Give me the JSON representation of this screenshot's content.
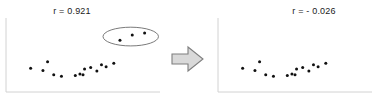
{
  "figure": {
    "caption_left": "r = 0.921",
    "caption_right": "r = - 0.026",
    "arrow_icon": "right-block-arrow-icon",
    "colors": {
      "point": "#111111",
      "axis": "#d2d2d2",
      "ellipse": "#6b6b6b",
      "arrow_fill": "#d9d9d9",
      "arrow_stroke": "#7f7f7f",
      "text": "#1a1a1a"
    }
  },
  "chart_data": [
    {
      "type": "scatter",
      "title": "r = 0.921",
      "panel": "left",
      "xlabel": "",
      "ylabel": "",
      "xlim": [
        0,
        100
      ],
      "ylim": [
        0,
        100
      ],
      "grid": false,
      "legend": null,
      "annotations": [
        {
          "kind": "ellipse",
          "label": "outlier-group-highlight",
          "cx": 81,
          "cy": 77,
          "rx": 18,
          "ry": 13
        }
      ],
      "series": [
        {
          "name": "main cluster",
          "points": [
            [
              16,
              33
            ],
            [
              27,
              42
            ],
            [
              24,
              30
            ],
            [
              31,
              24
            ],
            [
              36,
              22
            ],
            [
              45,
              23
            ],
            [
              48,
              25
            ],
            [
              50,
              24
            ],
            [
              51,
              32
            ],
            [
              55,
              34
            ],
            [
              59,
              29
            ],
            [
              62,
              38
            ],
            [
              65,
              35
            ],
            [
              70,
              40
            ]
          ]
        },
        {
          "name": "outliers",
          "points": [
            [
              74,
              72
            ],
            [
              82,
              79
            ],
            [
              90,
              82
            ]
          ]
        }
      ]
    },
    {
      "type": "scatter",
      "title": "r = - 0.026",
      "panel": "right",
      "xlabel": "",
      "ylabel": "",
      "xlim": [
        0,
        100
      ],
      "ylim": [
        0,
        100
      ],
      "grid": false,
      "legend": null,
      "annotations": [],
      "series": [
        {
          "name": "main cluster",
          "points": [
            [
              16,
              33
            ],
            [
              27,
              42
            ],
            [
              24,
              30
            ],
            [
              31,
              24
            ],
            [
              36,
              22
            ],
            [
              45,
              23
            ],
            [
              48,
              25
            ],
            [
              50,
              24
            ],
            [
              51,
              32
            ],
            [
              55,
              34
            ],
            [
              59,
              29
            ],
            [
              62,
              38
            ],
            [
              65,
              35
            ],
            [
              70,
              40
            ]
          ]
        }
      ]
    }
  ]
}
